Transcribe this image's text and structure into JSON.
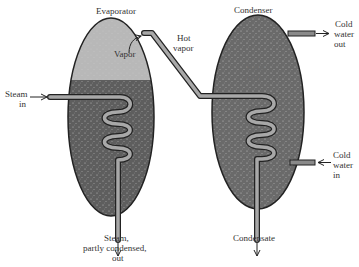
{
  "diagram": {
    "title_evaporator": "Evaporator",
    "title_condenser": "Condenser",
    "labels": {
      "vapor": "Vapor",
      "hot_vapor_line1": "Hot",
      "hot_vapor_line2": "vapor",
      "steam_in_line1": "Steam",
      "steam_in_line2": "in",
      "steam_out_line1": "Steam,",
      "steam_out_line2": "partly condensed,",
      "steam_out_line3": "out",
      "cold_water_inside_line1": "Cold",
      "cold_water_inside_line2": "water",
      "cold_water_out_line1": "Cold",
      "cold_water_out_line2": "water",
      "cold_water_out_line3": "out",
      "cold_water_in_line1": "Cold",
      "cold_water_in_line2": "water",
      "cold_water_in_line3": "in",
      "condensate": "Condensate"
    },
    "colors": {
      "vapor_region": "#b8b8b8",
      "liquid_region": "#5e5e5e",
      "condenser_fill": "#6a6a6a",
      "pipe_fill": "#a8a8a8",
      "outline": "#222222",
      "text": "#333333"
    }
  }
}
